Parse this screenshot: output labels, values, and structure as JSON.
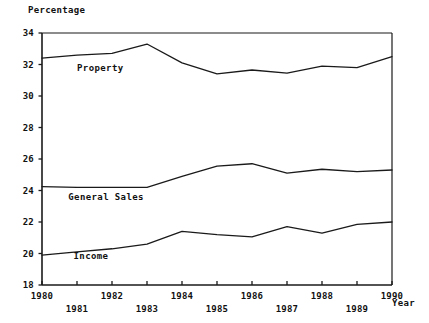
{
  "chart_data": {
    "type": "line",
    "title": "",
    "ylabel": "Percentage",
    "xlabel": "Year",
    "ylim": [
      18,
      34
    ],
    "xlim": [
      1980,
      1990
    ],
    "yticks": [
      18,
      20,
      22,
      24,
      26,
      28,
      30,
      32,
      34
    ],
    "xticks": [
      1980,
      1981,
      1982,
      1983,
      1984,
      1985,
      1986,
      1987,
      1988,
      1989,
      1990
    ],
    "xtick_labels_top": [
      "1980",
      "",
      "1982",
      "",
      "1984",
      "",
      "1986",
      "",
      "1988",
      "",
      "1990"
    ],
    "xtick_labels_bottom": [
      "",
      "1981",
      "",
      "1983",
      "",
      "1985",
      "",
      "1987",
      "",
      "1989",
      ""
    ],
    "grid": false,
    "legend": "inline-labels",
    "x": [
      1980,
      1981,
      1982,
      1983,
      1984,
      1985,
      1986,
      1987,
      1988,
      1989,
      1990
    ],
    "series": [
      {
        "name": "Property",
        "color": "#1a1a1a",
        "values": [
          32.4,
          32.6,
          32.7,
          33.3,
          32.1,
          31.4,
          31.65,
          31.45,
          31.9,
          31.8,
          32.5
        ],
        "label_x": 1981.0,
        "label_y": 31.8
      },
      {
        "name": "General Sales",
        "color": "#1a1a1a",
        "values": [
          24.25,
          24.2,
          24.2,
          24.2,
          24.9,
          25.55,
          25.7,
          25.1,
          25.35,
          25.2,
          25.3
        ],
        "label_x": 1980.75,
        "label_y": 23.6
      },
      {
        "name": "Income",
        "color": "#1a1a1a",
        "values": [
          19.9,
          20.1,
          20.3,
          20.6,
          21.4,
          21.2,
          21.05,
          21.7,
          21.3,
          21.85,
          22.0
        ],
        "label_x": 1980.9,
        "label_y": 19.85
      }
    ]
  },
  "axes": {
    "line_color": "#1a1a1a",
    "axis_width": 1.6
  }
}
